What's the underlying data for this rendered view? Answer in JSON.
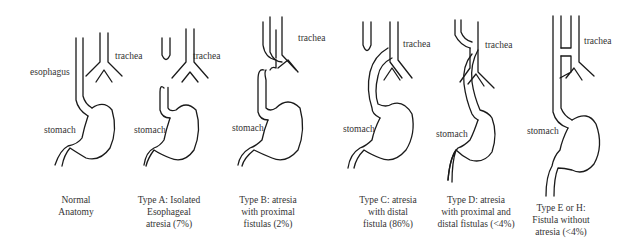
{
  "panels": [
    {
      "id": "normal",
      "labels": {
        "esophagus": "esophagus",
        "trachea": "trachea",
        "stomach": "stomach"
      },
      "caption": [
        "Normal",
        "Anatomy"
      ]
    },
    {
      "id": "type-a",
      "labels": {
        "trachea": "trachea",
        "stomach": "stomach"
      },
      "caption": [
        "Type A: Isolated",
        "Esophageal",
        "atresia (7%)"
      ]
    },
    {
      "id": "type-b",
      "labels": {
        "trachea": "trachea",
        "stomach": "stomach"
      },
      "caption": [
        "Type B: atresia",
        "with proximal",
        "fistulas (2%)"
      ]
    },
    {
      "id": "type-c",
      "labels": {
        "trachea": "trachea",
        "stomach": "stomach"
      },
      "caption": [
        "Type C: atresia",
        "with distal",
        "fistula (86%)"
      ]
    },
    {
      "id": "type-d",
      "labels": {
        "trachea": "trachea",
        "stomach": "stomach"
      },
      "caption": [
        "Type D: atresia",
        "with proximal and",
        "distal fistulas (<4%)"
      ]
    },
    {
      "id": "type-e-h",
      "labels": {
        "trachea": "trachea",
        "stomach": "stomach"
      },
      "caption": [
        "Type E or H:",
        "Fistula without",
        "atresia (<4%)"
      ]
    }
  ]
}
